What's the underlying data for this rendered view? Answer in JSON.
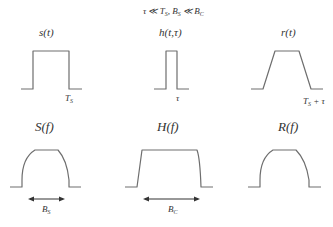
{
  "condition": "τ ≪ T",
  "condition_parts": {
    "tau": "τ",
    "ll1": " ≪ ",
    "Ts_main": "T",
    "Ts_sub": "S",
    "comma": ", ",
    "Bs_main": "B",
    "Bs_sub": "S",
    "ll2": " ≪ ",
    "Bc_main": "B",
    "Bc_sub": "C"
  },
  "time_domain": {
    "signal": {
      "label": "s(t)",
      "tick_main": "T",
      "tick_sub": "S"
    },
    "channel": {
      "label": "h(t,τ)",
      "tick": "τ"
    },
    "received": {
      "label": "r(t)",
      "tick_main": "T",
      "tick_sub": "S",
      "tick_suffix": " + τ"
    }
  },
  "freq_domain": {
    "signal": {
      "label": "S(f)",
      "band_main": "B",
      "band_sub": "S"
    },
    "channel": {
      "label": "H(f)",
      "band_main": "B",
      "band_sub": "C"
    },
    "received": {
      "label": "R(f)"
    }
  },
  "colors": {
    "curve": "#6e6e6e",
    "text": "#333333",
    "background": "#ffffff"
  }
}
